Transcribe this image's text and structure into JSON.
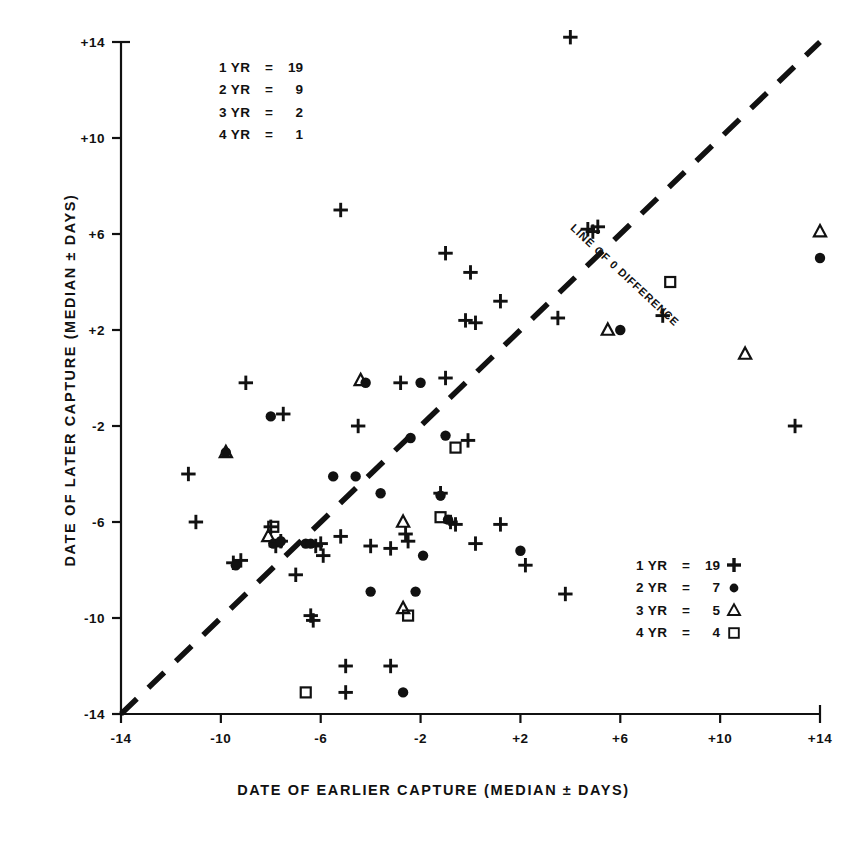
{
  "chart_data": {
    "type": "scatter",
    "title": "",
    "xlabel": "DATE OF EARLIER CAPTURE (MEDIAN ± DAYS)",
    "ylabel": "DATE OF LATER CAPTURE (MEDIAN ± DAYS)",
    "xlim": [
      -14,
      14
    ],
    "ylim": [
      -14,
      14
    ],
    "xticks": [
      "-14",
      "-10",
      "-6",
      "-2",
      "+2",
      "+6",
      "+10",
      "+14"
    ],
    "xtick_values": [
      -14,
      -10,
      -6,
      -2,
      2,
      6,
      10,
      14
    ],
    "yticks": [
      "+14",
      "+10",
      "+6",
      "+2",
      "-2",
      "-6",
      "-10",
      "-14"
    ],
    "ytick_values": [
      14,
      10,
      6,
      2,
      -2,
      -6,
      -10,
      -14
    ],
    "grid": false,
    "legend_position": "top-left and bottom-right",
    "annotations": [
      {
        "text": "LINE OF 0 DIFFERENCE",
        "x": 6.2,
        "y": 4.3,
        "rotation": -43
      }
    ],
    "reference_line": {
      "label": "LINE OF 0 DIFFERENCE",
      "style": "dashed",
      "from": [
        -14,
        -14
      ],
      "to": [
        14,
        14
      ]
    },
    "series": [
      {
        "name": "1 YR",
        "marker": "plus",
        "count_top": 19,
        "count_bottom": 19,
        "points": [
          [
            4.0,
            14.2
          ],
          [
            -5.2,
            7.0
          ],
          [
            -1.0,
            5.2
          ],
          [
            0.0,
            4.4
          ],
          [
            1.2,
            3.2
          ],
          [
            4.7,
            6.2
          ],
          [
            4.9,
            6.1
          ],
          [
            5.1,
            6.3
          ],
          [
            -9.0,
            -0.2
          ],
          [
            -7.5,
            -1.5
          ],
          [
            -4.5,
            -2.0
          ],
          [
            -2.8,
            -0.2
          ],
          [
            -1.0,
            0.0
          ],
          [
            -0.2,
            2.4
          ],
          [
            0.2,
            2.3
          ],
          [
            7.7,
            2.6
          ],
          [
            3.5,
            2.5
          ],
          [
            13.0,
            -2.0
          ],
          [
            -11.3,
            -4.0
          ],
          [
            -11.0,
            -6.0
          ],
          [
            -9.5,
            -7.7
          ],
          [
            -9.2,
            -7.6
          ],
          [
            -8.0,
            -6.2
          ],
          [
            -7.8,
            -7.0
          ],
          [
            -7.6,
            -6.8
          ],
          [
            -7.0,
            -8.2
          ],
          [
            -6.2,
            -7.0
          ],
          [
            -6.0,
            -6.9
          ],
          [
            -5.9,
            -7.4
          ],
          [
            -5.2,
            -6.6
          ],
          [
            -4.0,
            -7.0
          ],
          [
            -3.2,
            -7.1
          ],
          [
            -1.2,
            -4.8
          ],
          [
            -0.8,
            -6.0
          ],
          [
            -0.6,
            -6.1
          ],
          [
            0.2,
            -6.9
          ],
          [
            1.2,
            -6.1
          ],
          [
            2.2,
            -7.8
          ],
          [
            3.8,
            -9.0
          ],
          [
            -6.4,
            -9.9
          ],
          [
            -6.3,
            -10.1
          ],
          [
            -5.0,
            -12.0
          ],
          [
            -3.2,
            -12.0
          ],
          [
            -5.0,
            -13.1
          ],
          [
            -2.6,
            -6.5
          ],
          [
            -2.5,
            -6.8
          ],
          [
            -0.1,
            -2.6
          ]
        ]
      },
      {
        "name": "2 YR",
        "marker": "circle",
        "count_top": 9,
        "count_bottom": 7,
        "points": [
          [
            14.0,
            5.0
          ],
          [
            6.0,
            2.0
          ],
          [
            -8.0,
            -1.6
          ],
          [
            -4.2,
            -0.2
          ],
          [
            -2.0,
            -0.2
          ],
          [
            -2.4,
            -2.5
          ],
          [
            -9.8,
            -3.1
          ],
          [
            -5.5,
            -4.1
          ],
          [
            -4.6,
            -4.1
          ],
          [
            -3.6,
            -4.8
          ],
          [
            -0.9,
            -5.9
          ],
          [
            -1.9,
            -7.4
          ],
          [
            -1.2,
            -4.9
          ],
          [
            -7.9,
            -6.9
          ],
          [
            -7.6,
            -6.8
          ],
          [
            -6.6,
            -6.9
          ],
          [
            -6.4,
            -6.9
          ],
          [
            -9.4,
            -7.8
          ],
          [
            -4.0,
            -8.9
          ],
          [
            -2.2,
            -8.9
          ],
          [
            2.0,
            -7.2
          ],
          [
            -2.7,
            -13.1
          ],
          [
            -1.0,
            -2.4
          ]
        ]
      },
      {
        "name": "3 YR",
        "marker": "triangle",
        "count_top": 2,
        "count_bottom": 5,
        "points": [
          [
            14.0,
            6.1
          ],
          [
            11.0,
            1.0
          ],
          [
            5.5,
            2.0
          ],
          [
            -4.4,
            -0.1
          ],
          [
            -9.8,
            -3.1
          ],
          [
            -8.1,
            -6.6
          ],
          [
            -2.7,
            -6.0
          ],
          [
            -2.7,
            -9.6
          ]
        ]
      },
      {
        "name": "4 YR",
        "marker": "square",
        "count_top": 1,
        "count_bottom": 4,
        "points": [
          [
            8.0,
            4.0
          ],
          [
            -0.6,
            -2.9
          ],
          [
            -7.9,
            -6.2
          ],
          [
            -1.2,
            -5.8
          ],
          [
            -2.5,
            -9.9
          ],
          [
            -6.6,
            -13.1
          ]
        ]
      }
    ]
  },
  "legend_top": {
    "rows": [
      {
        "name": "1 YR",
        "eq": "=",
        "value": "19",
        "symbol": ""
      },
      {
        "name": "2 YR",
        "eq": "=",
        "value": "9",
        "symbol": ""
      },
      {
        "name": "3 YR",
        "eq": "=",
        "value": "2",
        "symbol": ""
      },
      {
        "name": "4 YR",
        "eq": "=",
        "value": "1",
        "symbol": ""
      }
    ]
  },
  "legend_bottom": {
    "rows": [
      {
        "name": "1 YR",
        "eq": "=",
        "value": "19",
        "symbol": "plus-marker"
      },
      {
        "name": "2 YR",
        "eq": "=",
        "value": "7",
        "symbol": "circle-marker"
      },
      {
        "name": "3 YR",
        "eq": "=",
        "value": "5",
        "symbol": "triangle-marker"
      },
      {
        "name": "4 YR",
        "eq": "=",
        "value": "4",
        "symbol": "square-marker"
      }
    ]
  },
  "colors": {
    "ink": "#111111",
    "background": "#ffffff"
  }
}
